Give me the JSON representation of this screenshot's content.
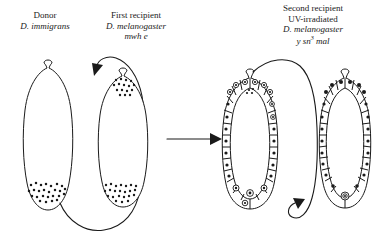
{
  "figure": {
    "type": "diagram",
    "background_color": "#ffffff",
    "ink_color": "#1a1a1a"
  },
  "labels": {
    "donor": {
      "line1": "Donor",
      "line2": "D. immigrans"
    },
    "first_recipient": {
      "line1": "First recipient",
      "line2": "D. melanogaster",
      "line3": "mwh e"
    },
    "second_recipient": {
      "line1": "Second recipient",
      "line2": "UV-irradiated",
      "line3": "D. melanogaster",
      "line4_a": "y sn",
      "line4_sup": "3",
      "line4_b": " mal"
    }
  },
  "embryos": [
    {
      "id": "embryo-donor",
      "name": "donor-embryo",
      "stage": "syncytial blastoderm with posterior pole cells",
      "pole_cells": "posterior cluster of small dots"
    },
    {
      "id": "embryo-first-recipient",
      "name": "first-recipient-embryo",
      "stage": "syncytial blastoderm",
      "pole_cells": "transplanted dots at anterior plus posterior dots"
    },
    {
      "id": "embryo-second-recipient-a",
      "name": "cellular-blastoderm-embryo",
      "stage": "cellular blastoderm",
      "pole_cells": "ring nuclei in anterior and posterior cells"
    },
    {
      "id": "embryo-second-recipient-b",
      "name": "uv-irradiated-embryo",
      "stage": "cellular blastoderm, UV-irradiated",
      "pole_cells": "solid nuclei with single recipient pole cell at posterior"
    }
  ],
  "arrows": [
    {
      "id": "arrow-donor-to-first",
      "name": "transplant-arrow-donor-to-first-recipient",
      "style": "long curved",
      "from": "donor embryo posterior pole cells",
      "to": "first recipient embryo anterior"
    },
    {
      "id": "arrow-first-to-second",
      "name": "transplant-arrow-first-to-second-recipient",
      "style": "straight horizontal",
      "from": "first recipient embryo",
      "to": "second recipient cellular blastoderm"
    },
    {
      "id": "arrow-second-to-uv",
      "name": "transplant-arrow-to-uv-irradiated-embryo",
      "style": "long curved",
      "from": "cellular blastoderm embryo anterior",
      "to": "UV-irradiated embryo posterior pole cell"
    }
  ]
}
